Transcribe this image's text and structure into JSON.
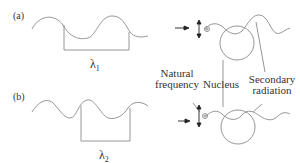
{
  "panels": [
    {
      "tag": "(a)",
      "wavelength_label": "λ",
      "wavelength_sub": "1"
    },
    {
      "tag": "(b)",
      "wavelength_label": "λ",
      "wavelength_sub": "2"
    }
  ],
  "annotations": {
    "natural_frequency_line1": "Natural",
    "natural_frequency_line2": "frequency",
    "nucleus": "Nucleus",
    "secondary_line1": "Secondary",
    "secondary_line2": "radiation"
  },
  "colors": {
    "line": "#8a8a8a",
    "text": "#333333",
    "arrow": "#222222"
  }
}
